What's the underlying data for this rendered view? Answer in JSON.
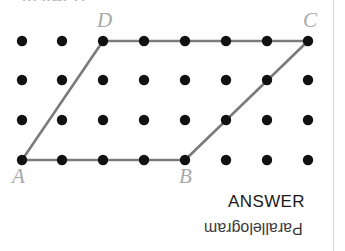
{
  "page": {
    "background_color": "#ffffff",
    "width": 345,
    "height": 251,
    "edge_rule_color": "#d6d6d6"
  },
  "problem": {
    "label": "b) ABCD",
    "label_color": "#b9b9b9"
  },
  "figure": {
    "name": "parallelogram-on-dot-grid",
    "dot_color": "#111111",
    "dot_radius": 5.2,
    "edge_color": "#7b7b7b",
    "edge_width": 2.6,
    "grid": {
      "columns": 8,
      "rows": 4,
      "column_x": [
        22,
        62,
        103,
        144,
        185,
        226,
        267,
        308
      ],
      "row_y": [
        41,
        80,
        120,
        160
      ]
    },
    "vertices": [
      {
        "id": "A",
        "label": "A",
        "col": 0,
        "row": 3,
        "x": 22,
        "y": 160,
        "label_x": 12,
        "label_y": 166
      },
      {
        "id": "B",
        "label": "B",
        "col": 4,
        "row": 3,
        "x": 185,
        "y": 160,
        "label_x": 179,
        "label_y": 166
      },
      {
        "id": "C",
        "label": "C",
        "col": 7,
        "row": 0,
        "x": 308,
        "y": 41,
        "label_x": 303,
        "label_y": 10
      },
      {
        "id": "D",
        "label": "D",
        "col": 2,
        "row": 0,
        "x": 103,
        "y": 41,
        "label_x": 97,
        "label_y": 10
      }
    ],
    "edges": [
      {
        "name": "edge-A-B",
        "from": "A",
        "to": "B"
      },
      {
        "name": "edge-B-C",
        "from": "B",
        "to": "C"
      },
      {
        "name": "edge-C-D",
        "from": "C",
        "to": "D"
      },
      {
        "name": "edge-D-A",
        "from": "D",
        "to": "A"
      }
    ]
  },
  "answer": {
    "heading": "ANSWER",
    "value": "Parallelogram",
    "value_rotated_180": true,
    "heading_color": "#1a1a1a",
    "value_color": "#3a3a3a"
  },
  "chart_data": {
    "type": "scatter",
    "title": "b) ABCD",
    "xlabel": "",
    "ylabel": "",
    "xlim": [
      0,
      7
    ],
    "ylim": [
      0,
      3
    ],
    "grid": false,
    "annotations": [
      "ANSWER",
      "Parallelogram"
    ],
    "series": [
      {
        "name": "dot-lattice",
        "x": [
          0,
          1,
          2,
          3,
          4,
          5,
          6,
          7,
          0,
          1,
          2,
          3,
          4,
          5,
          6,
          7,
          0,
          1,
          2,
          3,
          4,
          5,
          6,
          7,
          0,
          1,
          2,
          3,
          4,
          5,
          6,
          7
        ],
        "y": [
          3,
          3,
          3,
          3,
          3,
          3,
          3,
          3,
          2,
          2,
          2,
          2,
          2,
          2,
          2,
          2,
          1,
          1,
          1,
          1,
          1,
          1,
          1,
          1,
          0,
          0,
          0,
          0,
          0,
          0,
          0,
          0
        ]
      },
      {
        "name": "parallelogram-ABCD",
        "labels": [
          "A",
          "B",
          "C",
          "D"
        ],
        "x": [
          0,
          4,
          7,
          2,
          0
        ],
        "y": [
          0,
          0,
          3,
          3,
          0
        ]
      }
    ]
  }
}
